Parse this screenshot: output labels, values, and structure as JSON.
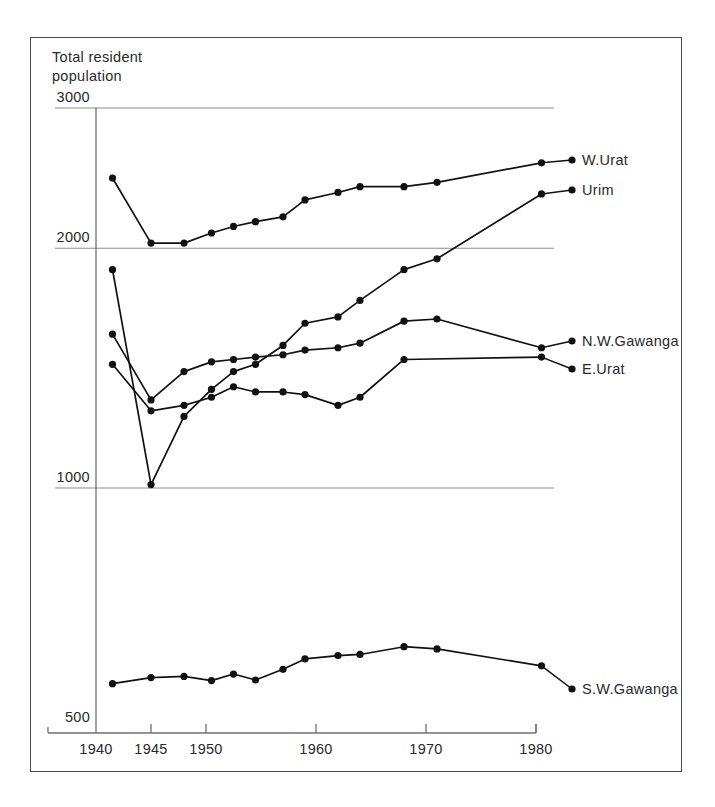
{
  "figure": {
    "axis_title": "Total resident\npopulation",
    "background_color": "#ffffff",
    "line_color": "#111111",
    "grid_color": "#8c8c8c"
  },
  "chart_data": {
    "type": "line",
    "title": "Total resident population",
    "xlabel": "",
    "ylabel": "Total resident population",
    "yscale": "log",
    "ylim": [
      500,
      3000
    ],
    "xlim": [
      1939,
      1981
    ],
    "grid": true,
    "gridlines_y": [
      3000,
      2000,
      1000
    ],
    "legend_position": "right-of-axes",
    "ytick_labels": [
      "3000",
      "2000",
      "1000",
      "500"
    ],
    "ytick_values": [
      3000,
      2000,
      1000,
      500
    ],
    "xtick_labels": [
      "1940",
      "1945",
      "1950",
      "1960",
      "1970",
      "1980"
    ],
    "xtick_values": [
      1940,
      1945,
      1950,
      1960,
      1970,
      1980
    ],
    "series": [
      {
        "name": "W.Urat",
        "label": "W.Urat",
        "x": [
          1941.5,
          1945,
          1948,
          1950.5,
          1952.5,
          1954.5,
          1957,
          1959,
          1962,
          1964,
          1968,
          1971,
          1980.5
        ],
        "y": [
          2450,
          2030,
          2030,
          2090,
          2130,
          2160,
          2190,
          2300,
          2350,
          2390,
          2390,
          2420,
          2560
        ]
      },
      {
        "name": "Urim",
        "label": "Urim",
        "x": [
          1941.5,
          1945,
          1948,
          1950.5,
          1952.5,
          1954.5,
          1957,
          1959,
          1962,
          1964,
          1968,
          1971,
          1980.5
        ],
        "y": [
          1880,
          1010,
          1230,
          1330,
          1400,
          1430,
          1510,
          1610,
          1640,
          1720,
          1880,
          1940,
          2340
        ]
      },
      {
        "name": "N.W.Gawanga",
        "label": "N.W.Gawanga",
        "x": [
          1941.5,
          1945,
          1948,
          1950.5,
          1952.5,
          1954.5,
          1957,
          1959,
          1962,
          1964,
          1968,
          1971,
          1980.5
        ],
        "y": [
          1560,
          1290,
          1400,
          1440,
          1450,
          1460,
          1470,
          1490,
          1500,
          1520,
          1620,
          1630,
          1500
        ]
      },
      {
        "name": "E.Urat",
        "label": "E.Urat",
        "x": [
          1941.5,
          1945,
          1948,
          1950.5,
          1952.5,
          1954.5,
          1957,
          1959,
          1962,
          1964,
          1968,
          1980.5
        ],
        "y": [
          1430,
          1250,
          1270,
          1300,
          1340,
          1320,
          1320,
          1310,
          1270,
          1300,
          1450,
          1460
        ]
      },
      {
        "name": "S.W.Gawanga",
        "label": "S.W.Gawanga",
        "x": [
          1941.5,
          1945,
          1948,
          1950.5,
          1952.5,
          1954.5,
          1957,
          1959,
          1962,
          1964,
          1968,
          1971,
          1980.5
        ],
        "y": [
          568,
          578,
          580,
          573,
          584,
          574,
          592,
          610,
          616,
          618,
          632,
          628,
          598
        ]
      }
    ]
  }
}
